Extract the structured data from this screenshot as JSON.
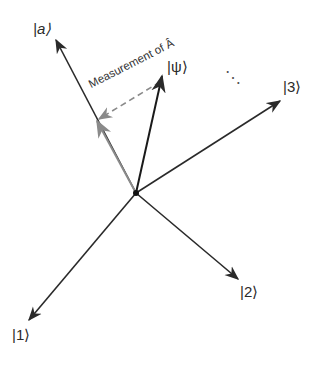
{
  "diagram": {
    "origin": {
      "x": 136,
      "y": 193
    },
    "vectors": [
      {
        "id": "a",
        "label": "|a⟩",
        "tip": {
          "x": 56,
          "y": 40
        },
        "color": "#2a2a2a"
      },
      {
        "id": "psi",
        "label": "|ψ⟩",
        "tip": {
          "x": 162,
          "y": 76
        },
        "color": "#1a1a1a"
      },
      {
        "id": "3",
        "label": "|3⟩",
        "tip": {
          "x": 280,
          "y": 101
        },
        "color": "#2a2a2a"
      },
      {
        "id": "2",
        "label": "|2⟩",
        "tip": {
          "x": 238,
          "y": 279
        },
        "color": "#2a2a2a"
      },
      {
        "id": "1",
        "label": "|1⟩",
        "tip": {
          "x": 29,
          "y": 320
        },
        "color": "#2a2a2a"
      }
    ],
    "projection": {
      "tip": {
        "x": 97,
        "y": 121
      },
      "color": "#8a8a8a"
    },
    "measurement_label": "Measurement of Â",
    "ellipsis": "⋱",
    "labels": {
      "a": "|a⟩",
      "psi": "|ψ⟩",
      "three": "|3⟩",
      "two": "|2⟩",
      "one": "|1⟩"
    }
  }
}
